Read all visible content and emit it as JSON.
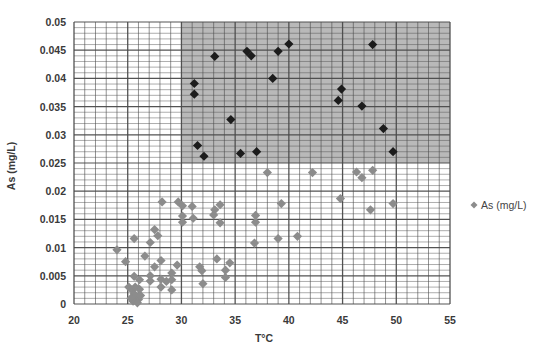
{
  "chart_data": {
    "type": "scatter",
    "title": "",
    "xlabel": "T°C",
    "ylabel": "As (mg/L)",
    "xlim": [
      20,
      55
    ],
    "ylim": [
      0,
      0.05
    ],
    "x_ticks": [
      "20",
      "25",
      "30",
      "35",
      "40",
      "45",
      "50",
      "55"
    ],
    "y_ticks": [
      "0",
      "0.005",
      "0.01",
      "0.015",
      "0.02",
      "0.025",
      "0.03",
      "0.035",
      "0.04",
      "0.045",
      "0.05"
    ],
    "grid": true,
    "minor_grid": {
      "x_step": 1,
      "y_step": 0.001
    },
    "legend": {
      "placement": "right",
      "entries": [
        "As (mg/L)"
      ]
    },
    "highlight_region": {
      "x_range": [
        30,
        55
      ],
      "y_range": [
        0.025,
        0.05
      ],
      "color": "#b9b9b9"
    },
    "colors": {
      "series": "#8c8c8c",
      "highlighted": "#1c1c1c",
      "grid": "#4a4a4a",
      "background": "#ffffff"
    },
    "series": [
      {
        "name": "As (mg/L)",
        "color": "#8c8c8c",
        "points": [
          [
            24.0,
            0.0096
          ],
          [
            24.8,
            0.0075
          ],
          [
            25.6,
            0.0116
          ],
          [
            25.6,
            0.0049
          ],
          [
            25.1,
            0.003
          ],
          [
            26.1,
            0.0043
          ],
          [
            26.6,
            0.0085
          ],
          [
            27.1,
            0.0109
          ],
          [
            27.5,
            0.0132
          ],
          [
            27.8,
            0.0121
          ],
          [
            28.2,
            0.0181
          ],
          [
            27.1,
            0.005
          ],
          [
            27.1,
            0.0041
          ],
          [
            27.5,
            0.0066
          ],
          [
            28.1,
            0.0077
          ],
          [
            28.1,
            0.0044
          ],
          [
            28.1,
            0.003
          ],
          [
            28.6,
            0.004
          ],
          [
            29.1,
            0.0055
          ],
          [
            29.1,
            0.0043
          ],
          [
            29.1,
            0.0025
          ],
          [
            29.6,
            0.0069
          ],
          [
            29.7,
            0.0181
          ],
          [
            30.1,
            0.0174
          ],
          [
            30.1,
            0.0156
          ],
          [
            30.1,
            0.0145
          ],
          [
            31.0,
            0.0173
          ],
          [
            31.1,
            0.0152
          ],
          [
            33.1,
            0.0167
          ],
          [
            33.6,
            0.0176
          ],
          [
            33.0,
            0.0158
          ],
          [
            33.6,
            0.0144
          ],
          [
            36.9,
            0.0157
          ],
          [
            36.9,
            0.0145
          ],
          [
            36.8,
            0.0108
          ],
          [
            33.3,
            0.008
          ],
          [
            31.7,
            0.0066
          ],
          [
            31.9,
            0.0059
          ],
          [
            34.5,
            0.0073
          ],
          [
            34.1,
            0.006
          ],
          [
            34.1,
            0.0047
          ],
          [
            32.0,
            0.0036
          ],
          [
            38.0,
            0.0233
          ],
          [
            42.2,
            0.0233
          ],
          [
            46.3,
            0.0234
          ],
          [
            46.8,
            0.0224
          ],
          [
            47.8,
            0.0237
          ],
          [
            39.3,
            0.0178
          ],
          [
            44.8,
            0.0187
          ],
          [
            47.6,
            0.0167
          ],
          [
            49.7,
            0.0178
          ],
          [
            39.0,
            0.0116
          ],
          [
            40.8,
            0.012
          ],
          [
            25.4,
            0.0025
          ],
          [
            25.6,
            0.0018
          ],
          [
            25.8,
            0.0012
          ],
          [
            26.0,
            0.0008
          ],
          [
            25.5,
            0.0005
          ],
          [
            25.9,
            0.0002
          ],
          [
            26.2,
            0.0015
          ],
          [
            25.3,
            0.001
          ],
          [
            26.1,
            0.0026
          ],
          [
            25.7,
            0.003
          ]
        ]
      },
      {
        "name": "As (mg/L) > 0.025 & T > 30",
        "color": "#1c1c1c",
        "points": [
          [
            31.2,
            0.0391
          ],
          [
            31.2,
            0.0372
          ],
          [
            33.1,
            0.0439
          ],
          [
            36.1,
            0.0448
          ],
          [
            36.5,
            0.044
          ],
          [
            39.0,
            0.0448
          ],
          [
            40.0,
            0.0461
          ],
          [
            38.5,
            0.04
          ],
          [
            34.6,
            0.0327
          ],
          [
            31.5,
            0.0281
          ],
          [
            32.1,
            0.0262
          ],
          [
            35.5,
            0.0267
          ],
          [
            37.0,
            0.027
          ],
          [
            47.8,
            0.046
          ],
          [
            44.9,
            0.0381
          ],
          [
            44.6,
            0.0361
          ],
          [
            46.8,
            0.0351
          ],
          [
            48.8,
            0.0311
          ],
          [
            49.7,
            0.027
          ]
        ]
      }
    ]
  }
}
